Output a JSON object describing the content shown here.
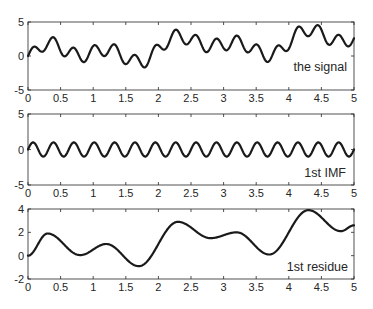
{
  "chart_data": [
    {
      "type": "line",
      "title": "",
      "annotation": "the signal",
      "xlabel": "",
      "ylabel": "",
      "xlim": [
        0,
        5
      ],
      "ylim": [
        -5,
        5
      ],
      "xticks": [
        "0",
        "0.5",
        "1",
        "1.5",
        "2",
        "2.5",
        "3",
        "3.5",
        "4",
        "4.5",
        "5"
      ],
      "yticks": [
        "-5",
        "0",
        "5"
      ],
      "grid": false,
      "series": [
        {
          "name": "the signal",
          "definition": "1st IMF + 1st residue"
        }
      ]
    },
    {
      "type": "line",
      "title": "",
      "annotation": "1st IMF",
      "xlabel": "",
      "ylabel": "",
      "xlim": [
        0,
        5
      ],
      "ylim": [
        -5,
        5
      ],
      "xticks": [
        "0",
        "0.5",
        "1",
        "1.5",
        "2",
        "2.5",
        "3",
        "3.5",
        "4",
        "4.5",
        "5"
      ],
      "yticks": [
        "-5",
        "0",
        "5"
      ],
      "grid": false,
      "series": [
        {
          "name": "1st IMF",
          "form": "sinusoid",
          "amplitude": 1.0,
          "frequency_hz": 3.2,
          "cycles_in_window": 16
        }
      ]
    },
    {
      "type": "line",
      "title": "",
      "annotation": "1st residue",
      "xlabel": "",
      "ylabel": "",
      "xlim": [
        0,
        5
      ],
      "ylim": [
        -2,
        4
      ],
      "xticks": [
        "0",
        "0.5",
        "1",
        "1.5",
        "2",
        "2.5",
        "3",
        "3.5",
        "4",
        "4.5",
        "5"
      ],
      "yticks": [
        "-2",
        "0",
        "2",
        "4"
      ],
      "grid": false,
      "series": [
        {
          "name": "1st residue",
          "x": [
            0,
            0.3,
            0.8,
            1.2,
            1.7,
            2.3,
            2.8,
            3.2,
            3.7,
            4.3,
            4.8,
            5.0
          ],
          "y": [
            0,
            1.9,
            0.05,
            1.0,
            -0.9,
            2.9,
            1.5,
            2.0,
            0.1,
            3.9,
            2.1,
            2.6
          ]
        }
      ]
    }
  ],
  "panels": [
    {
      "label": "the signal",
      "yticks": [
        "5",
        "0",
        "-5"
      ]
    },
    {
      "label": "1st IMF",
      "yticks": [
        "5",
        "0",
        "-5"
      ]
    },
    {
      "label": "1st residue",
      "yticks": [
        "4",
        "2",
        "0",
        "-2"
      ]
    }
  ],
  "xtick_labels": [
    "0",
    "0.5",
    "1",
    "1.5",
    "2",
    "2.5",
    "3",
    "3.5",
    "4",
    "4.5",
    "5"
  ]
}
